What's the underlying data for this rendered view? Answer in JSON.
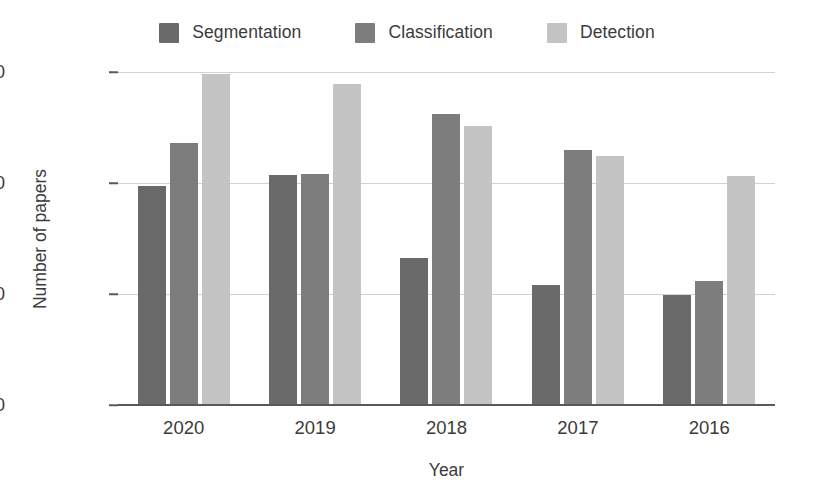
{
  "chart_data": {
    "type": "bar",
    "title": "",
    "subtitle": "",
    "xlabel": "Year",
    "ylabel": "Number of papers",
    "categories": [
      "2020",
      "2019",
      "2018",
      "2017",
      "2016"
    ],
    "series": [
      {
        "name": "Segmentation",
        "color": "#6a6a6a",
        "values": [
          985,
          1035,
          660,
          540,
          495
        ]
      },
      {
        "name": "Classification",
        "color": "#7d7d7d",
        "values": [
          1180,
          1040,
          1310,
          1150,
          560
        ]
      },
      {
        "name": "Detection",
        "color": "#c4c4c4",
        "values": [
          1490,
          1445,
          1255,
          1120,
          1030
        ]
      }
    ],
    "ylim": [
      0,
      1500
    ],
    "yticks": [
      0,
      500,
      1000,
      1500
    ],
    "ytick_labels": [
      "0",
      "500",
      "1000",
      "1500"
    ],
    "grid": true,
    "grid_axis": "y",
    "grid_color": "#d2d2d2",
    "legend_position": "top-center",
    "bar_group_order": [
      "Segmentation",
      "Classification",
      "Detection"
    ],
    "axis_color": "#5a5a5a",
    "background_color": "#ffffff"
  }
}
